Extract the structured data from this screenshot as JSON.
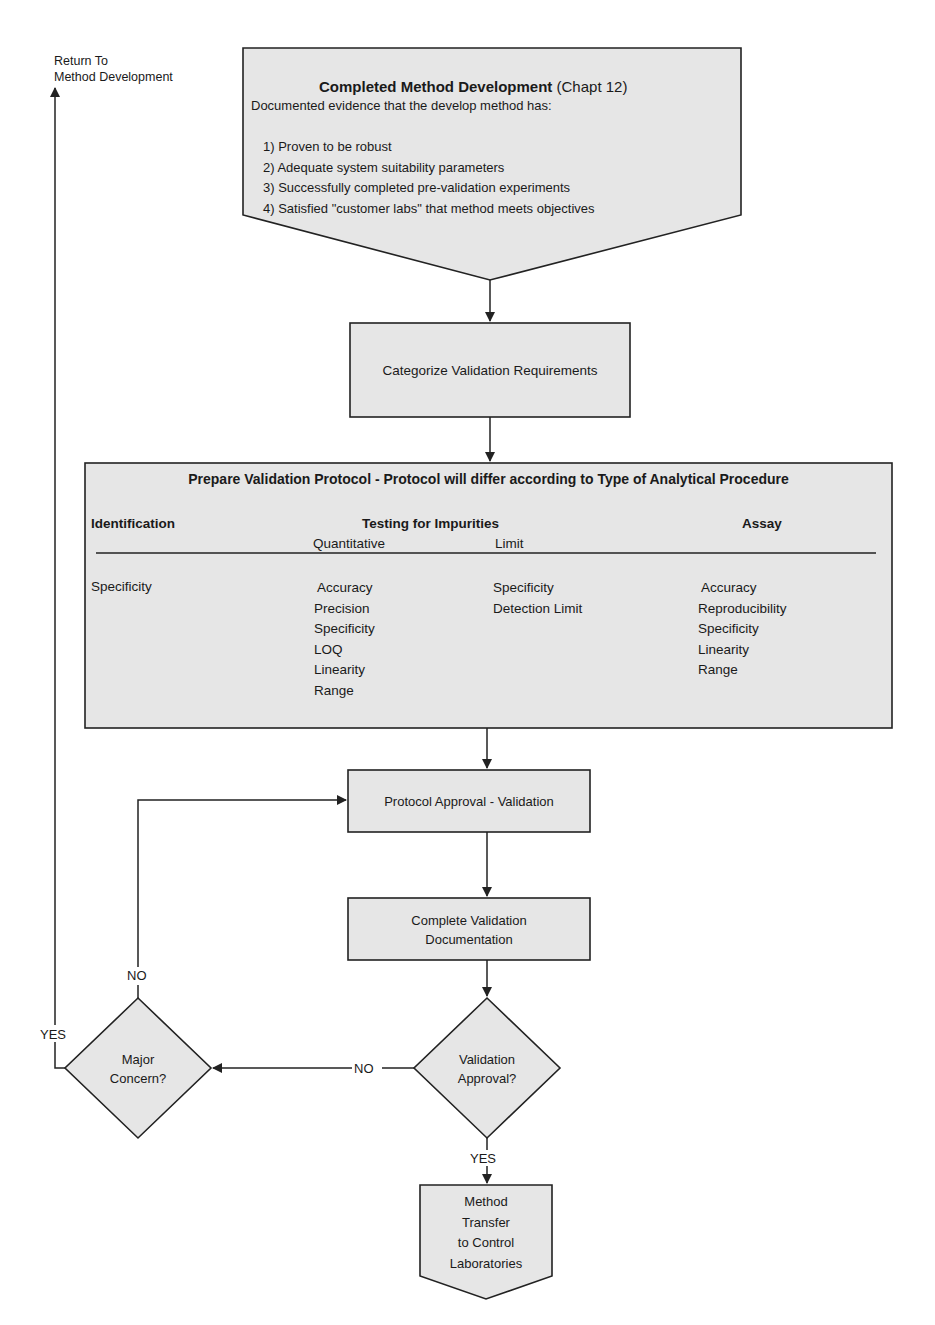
{
  "return_label": {
    "line1": "Return To",
    "line2": "Method Development"
  },
  "start_node": {
    "title": "Completed Method Development",
    "title_suffix": "(Chapt 12)",
    "intro": "Documented evidence that the develop method has:",
    "items": [
      "1) Proven to be robust",
      "2) Adequate system suitability parameters",
      "3) Successfully completed pre-validation experiments",
      "4) Satisfied \"customer labs\" that method meets objectives"
    ]
  },
  "categorize_node": {
    "label": "Categorize Validation Requirements"
  },
  "protocol_node": {
    "title": "Prepare Validation Protocol - Protocol will differ according to Type of Analytical Procedure",
    "columns": {
      "identification": {
        "header": "Identification",
        "items": [
          "Specificity"
        ]
      },
      "impurities": {
        "header": "Testing for Impurities",
        "quantitative": {
          "header": "Quantitative",
          "items": [
            "Accuracy",
            "Precision",
            "Specificity",
            "LOQ",
            "Linearity",
            "Range"
          ]
        },
        "limit": {
          "header": "Limit",
          "items": [
            "Specificity",
            "Detection Limit"
          ]
        }
      },
      "assay": {
        "header": "Assay",
        "items": [
          "Accuracy",
          "Reproducibility",
          "Specificity",
          "Linearity",
          "Range"
        ]
      }
    }
  },
  "approval_node": {
    "label": "Protocol Approval - Validation"
  },
  "documentation_node": {
    "line1": "Complete Validation",
    "line2": "Documentation"
  },
  "validation_decision": {
    "line1": "Validation",
    "line2": "Approval?"
  },
  "concern_decision": {
    "line1": "Major",
    "line2": "Concern?"
  },
  "end_node": {
    "lines": [
      "Method",
      "Transfer",
      "to Control",
      "Laboratories"
    ]
  },
  "edge_labels": {
    "validation_no": "NO",
    "validation_yes": "YES",
    "concern_no": "NO",
    "concern_yes": "YES"
  },
  "colors": {
    "node_fill": "#e6e6e6",
    "stroke": "#222222",
    "text": "#1a1a1a",
    "background": "#ffffff"
  }
}
